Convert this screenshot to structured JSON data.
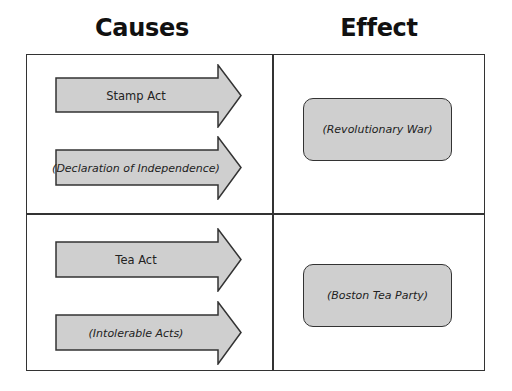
{
  "headers": {
    "causes": "Causes",
    "effect": "Effect"
  },
  "rows": [
    {
      "causes": [
        {
          "label": "Stamp Act",
          "italic": false
        },
        {
          "label": "(Declaration of Independence)",
          "italic": true
        }
      ],
      "effect": "(Revolutionary War)"
    },
    {
      "causes": [
        {
          "label": "Tea Act",
          "italic": false
        },
        {
          "label": "(Intolerable Acts)",
          "italic": true
        }
      ],
      "effect": "(Boston Tea Party)"
    }
  ],
  "colors": {
    "shape_fill": "#cfcfcf",
    "stroke": "#333333"
  }
}
